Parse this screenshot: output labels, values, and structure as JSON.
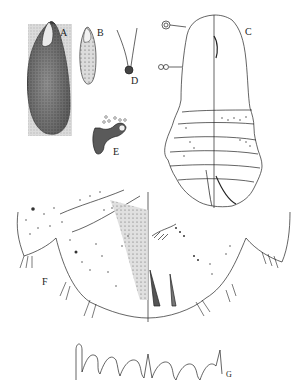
{
  "figure": {
    "type": "scientific-illustration-plate",
    "background": "#ffffff",
    "ink": "#1a1a1a",
    "panels": [
      {
        "id": "A",
        "label": "A",
        "description": "test / scale cover, large elongate dark stippled"
      },
      {
        "id": "B",
        "label": "B",
        "description": "smaller elongate scale"
      },
      {
        "id": "D",
        "label": "D",
        "description": "spiracle / gland with two filaments"
      },
      {
        "id": "E",
        "label": "E",
        "description": "anal plate / ostiole with small pores"
      },
      {
        "id": "C",
        "label": "C",
        "description": "adult female body outline, dorsal/ventral halves"
      },
      {
        "id": "F",
        "label": "F",
        "description": "pygidium detail with pores and setae"
      },
      {
        "id": "G",
        "label": "G",
        "description": "margin lobes and plates"
      }
    ]
  }
}
